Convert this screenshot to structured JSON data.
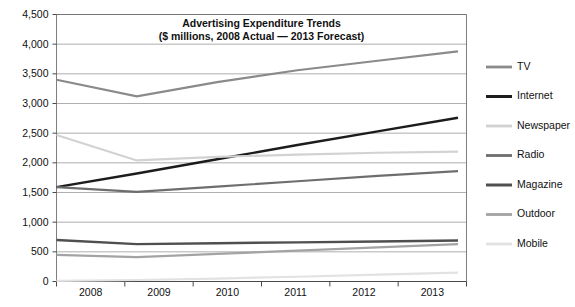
{
  "chart_data": {
    "type": "line",
    "title": "Advertising Expenditure Trends",
    "subtitle": "($ millions, 2008 Actual — 2013 Forecast)",
    "xlabel": "",
    "ylabel": "",
    "x": [
      "2008",
      "2009",
      "2010",
      "2011",
      "2012",
      "2013"
    ],
    "categories": [
      "2008",
      "2009",
      "2010",
      "2011",
      "2012",
      "2013"
    ],
    "ylim": [
      0,
      4500
    ],
    "ytick_step": 500,
    "yticks": [
      "0",
      "500",
      "1,000",
      "1,500",
      "2,000",
      "2,500",
      "3,000",
      "3,500",
      "4,000",
      "4,500"
    ],
    "ytick_values": [
      0,
      500,
      1000,
      1500,
      2000,
      2500,
      3000,
      3500,
      4000,
      4500
    ],
    "grid": true,
    "grid_axis": "y",
    "legend_position": "right",
    "series": [
      {
        "name": "TV",
        "color": "#8a8a8a",
        "width": 2.2,
        "values": [
          3400,
          3120,
          3360,
          3560,
          3720,
          3880
        ]
      },
      {
        "name": "Internet",
        "color": "#1c1c1c",
        "width": 2.4,
        "values": [
          1590,
          1820,
          2060,
          2300,
          2530,
          2760
        ]
      },
      {
        "name": "Newspaper",
        "color": "#d2d2d2",
        "width": 2.2,
        "values": [
          2470,
          2040,
          2100,
          2140,
          2170,
          2190
        ]
      },
      {
        "name": "Radio",
        "color": "#6e6e6e",
        "width": 2.2,
        "values": [
          1590,
          1510,
          1600,
          1690,
          1780,
          1860
        ]
      },
      {
        "name": "Magazine",
        "color": "#4f4f4f",
        "width": 2.4,
        "values": [
          700,
          630,
          645,
          660,
          675,
          690
        ]
      },
      {
        "name": "Outdoor",
        "color": "#a3a3a3",
        "width": 2.2,
        "values": [
          450,
          410,
          465,
          520,
          575,
          630
        ]
      },
      {
        "name": "Mobile",
        "color": "#e2e2e2",
        "width": 2.2,
        "values": [
          10,
          25,
          50,
          80,
          115,
          150
        ]
      }
    ]
  }
}
